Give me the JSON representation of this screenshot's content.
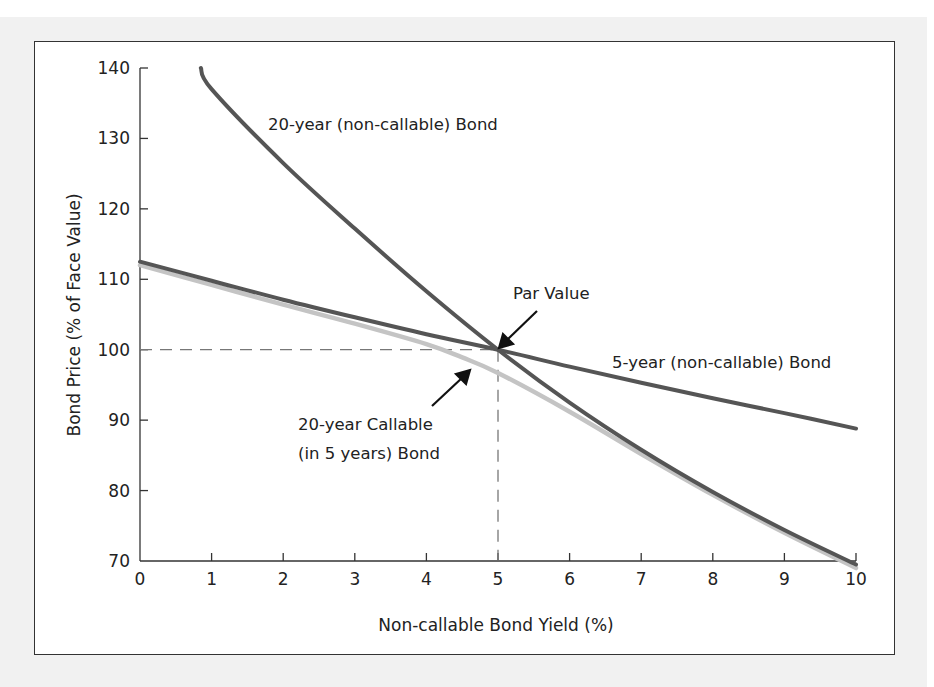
{
  "chart_data": {
    "type": "line",
    "title": "",
    "xlabel": "Non-callable Bond Yield (%)",
    "ylabel": "Bond Price (% of Face Value)",
    "xlim": [
      0,
      10
    ],
    "ylim": [
      70,
      140
    ],
    "x_ticks": [
      0,
      1,
      2,
      3,
      4,
      5,
      6,
      7,
      8,
      9,
      10
    ],
    "y_ticks": [
      70,
      80,
      90,
      100,
      110,
      120,
      130,
      140
    ],
    "grid": false,
    "legend": "inline annotations",
    "series": [
      {
        "name": "20-year (non-callable) Bond",
        "color": "#555555",
        "x": [
          0.85,
          1,
          2,
          3,
          4,
          5,
          6,
          7,
          8,
          9,
          10
        ],
        "y": [
          140,
          137.0,
          126.5,
          117.2,
          108.3,
          100,
          92.5,
          85.8,
          79.8,
          74.4,
          69.5
        ]
      },
      {
        "name": "5-year (non-callable) Bond",
        "color": "#555555",
        "x": [
          0,
          1,
          2,
          3,
          4,
          5,
          6,
          7,
          8,
          9,
          10
        ],
        "y": [
          112.5,
          109.8,
          107.1,
          104.6,
          102.2,
          100,
          97.6,
          95.3,
          93.1,
          91.0,
          88.8
        ]
      },
      {
        "name": "20-year Callable (in 5 years) Bond",
        "color": "#c4c4c4",
        "x": [
          0,
          1,
          2,
          3,
          4,
          4.5,
          5,
          6,
          7,
          8,
          9,
          10
        ],
        "y": [
          112.0,
          109.2,
          106.4,
          103.7,
          100.8,
          98.9,
          96.7,
          91.2,
          85.2,
          79.4,
          74.0,
          69.0
        ]
      }
    ],
    "reference_lines": [
      {
        "type": "horizontal-dashed",
        "y": 100,
        "x_range": [
          0,
          5
        ]
      },
      {
        "type": "vertical-dashed",
        "x": 5,
        "y_range": [
          70,
          100
        ]
      }
    ],
    "annotations": [
      {
        "text": "20-year (non-callable) Bond",
        "x": 1.8,
        "y": 132
      },
      {
        "text": "Par Value",
        "x": 5.3,
        "y": 107,
        "arrow_to": [
          5,
          100
        ]
      },
      {
        "text": "5-year (non-callable) Bond",
        "x": 6.5,
        "y": 98
      },
      {
        "text": "20-year Callable",
        "x": 3.0,
        "y": 90
      },
      {
        "text": "(in 5 years) Bond",
        "x": 3.0,
        "y": 86,
        "arrow_to": [
          4.6,
          98
        ]
      }
    ]
  },
  "labels": {
    "xlabel": "Non-callable Bond Yield (%)",
    "ylabel": "Bond Price (% of Face Value)",
    "series_20yr": "20-year (non-callable) Bond",
    "series_5yr": "5-year (non-callable) Bond",
    "par_value": "Par Value",
    "callable_line1": "20-year Callable",
    "callable_line2": "(in 5 years) Bond",
    "x_ticks": [
      "0",
      "1",
      "2",
      "3",
      "4",
      "5",
      "6",
      "7",
      "8",
      "9",
      "10"
    ],
    "y_ticks": [
      "70",
      "80",
      "90",
      "100",
      "110",
      "120",
      "130",
      "140"
    ]
  }
}
